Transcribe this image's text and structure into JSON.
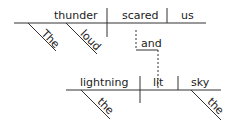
{
  "diagram": {
    "type": "sentence-diagram",
    "clause1": {
      "subject": "thunder",
      "verb": "scared",
      "object": "us",
      "modifiers": [
        "The",
        "loud"
      ]
    },
    "conjunction": "and",
    "clause2": {
      "subject": "lightning",
      "verb": "lit",
      "object": "sky",
      "subject_modifiers": [
        "the"
      ],
      "object_modifiers": [
        "the"
      ]
    }
  }
}
